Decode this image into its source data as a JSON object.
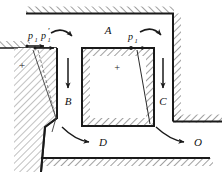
{
  "figure": {
    "background": "#ffffff",
    "ink": "#1a1a1a",
    "hatch_color": "#2b2b2b",
    "width": 222,
    "height": 172
  },
  "labels": {
    "block_a": "A",
    "zone_b": "B",
    "zone_c": "C",
    "zone_d": "D",
    "zone_o": "O",
    "pressure_left": "p",
    "pressure_left_sub": "1",
    "pressure_left_prime": "p",
    "pressure_left_prime_sub": "1",
    "pressure_left_prime_mark": "'",
    "pressure_right": "p",
    "pressure_right_sub": "1",
    "plus_left": "+",
    "plus_center": "+"
  },
  "icon_names": {
    "arrow_down_b": "down-arrow-icon",
    "arrow_down_c": "down-arrow-icon",
    "arrow_curve_d": "curved-arrow-icon",
    "arrow_curve_o": "curved-arrow-icon",
    "arrow_rot_left": "rotation-arrow-icon",
    "arrow_rot_right": "rotation-arrow-icon",
    "vector_p1": "force-vector-icon",
    "vector_p1_prime": "force-vector-icon",
    "vector_p1_right": "force-vector-icon"
  },
  "geometry": {
    "note": "Hatched ground mass with open trench; central soil block A; failure wedges on left wall and right of block A."
  }
}
